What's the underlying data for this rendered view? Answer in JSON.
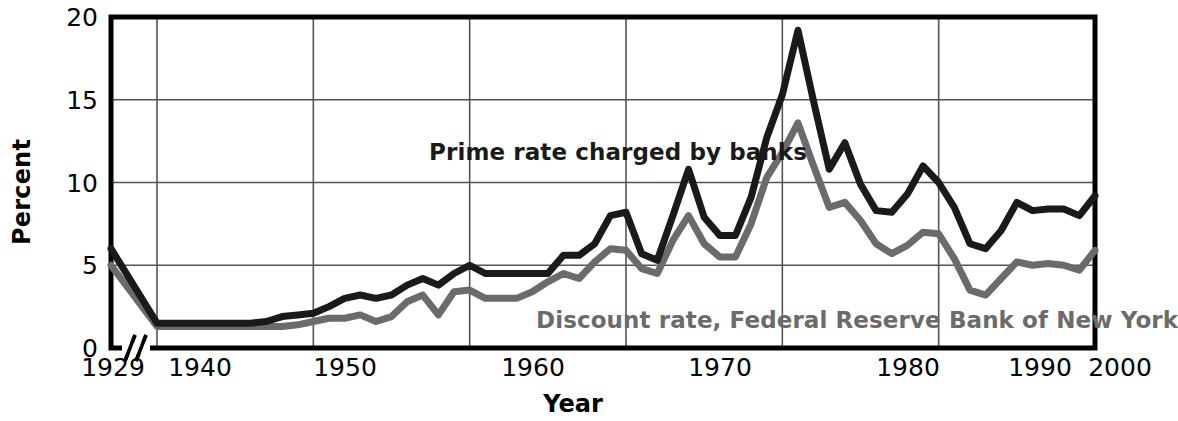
{
  "chart_data": {
    "type": "line",
    "title": "",
    "xlabel": "Year",
    "ylabel": "Percent",
    "ylim": [
      0,
      20
    ],
    "yticks": [
      0,
      5,
      10,
      15,
      20
    ],
    "ytick_labels": [
      "0",
      "5",
      "10",
      "15",
      "20"
    ],
    "xticks": [
      1929,
      1940,
      1950,
      1960,
      1970,
      1980,
      1990,
      2000
    ],
    "xtick_labels": [
      "1929",
      "1940",
      "1950",
      "1960",
      "1970",
      "1980",
      "1990",
      "2000"
    ],
    "axis_break": true,
    "axis_break_note": "break in x-axis between 1929 and 1940",
    "grid": true,
    "legend_position": "inline-annotations",
    "colors": {
      "prime_rate": "#1a1a1a",
      "discount_rate": "#6b6b6b",
      "axis": "#000000",
      "grid": "#555555",
      "background": "#ffffff"
    },
    "annotations": [
      {
        "text": "Prime rate charged by banks",
        "color": "#1a1a1a"
      },
      {
        "text": "Discount rate, Federal Reserve Bank of New York",
        "color": "#6b6b6b"
      }
    ],
    "x": [
      1929,
      1940,
      1941,
      1942,
      1943,
      1944,
      1945,
      1946,
      1947,
      1948,
      1949,
      1950,
      1951,
      1952,
      1953,
      1954,
      1955,
      1956,
      1957,
      1958,
      1959,
      1960,
      1961,
      1962,
      1963,
      1964,
      1965,
      1966,
      1967,
      1968,
      1969,
      1970,
      1971,
      1972,
      1973,
      1974,
      1975,
      1976,
      1977,
      1978,
      1979,
      1980,
      1981,
      1982,
      1983,
      1984,
      1985,
      1986,
      1987,
      1988,
      1989,
      1990,
      1991,
      1992,
      1993,
      1994,
      1995,
      1996,
      1997,
      1998,
      1999,
      2000
    ],
    "series": [
      {
        "name": "Prime rate charged by banks",
        "color": "#1a1a1a",
        "values": [
          6.0,
          1.5,
          1.5,
          1.5,
          1.5,
          1.5,
          1.5,
          1.5,
          1.6,
          1.9,
          2.0,
          2.1,
          2.5,
          3.0,
          3.2,
          3.0,
          3.2,
          3.8,
          4.2,
          3.8,
          4.5,
          5.0,
          4.5,
          4.5,
          4.5,
          4.5,
          4.5,
          5.6,
          5.6,
          6.3,
          8.0,
          8.2,
          5.7,
          5.3,
          8.0,
          10.8,
          7.9,
          6.8,
          6.8,
          9.1,
          12.7,
          15.3,
          19.2,
          14.9,
          10.8,
          12.4,
          9.9,
          8.3,
          8.2,
          9.3,
          11.0,
          10.0,
          8.5,
          6.3,
          6.0,
          7.1,
          8.8,
          8.3,
          8.4,
          8.4,
          8.0,
          9.2
        ]
      },
      {
        "name": "Discount rate, Federal Reserve Bank of New York",
        "color": "#6b6b6b",
        "values": [
          5.0,
          1.3,
          1.3,
          1.3,
          1.3,
          1.3,
          1.3,
          1.3,
          1.3,
          1.3,
          1.4,
          1.6,
          1.8,
          1.8,
          2.0,
          1.6,
          1.9,
          2.8,
          3.2,
          2.0,
          3.4,
          3.5,
          3.0,
          3.0,
          3.0,
          3.4,
          4.0,
          4.5,
          4.2,
          5.2,
          6.0,
          5.9,
          4.8,
          4.5,
          6.5,
          8.0,
          6.3,
          5.5,
          5.5,
          7.5,
          10.3,
          11.8,
          13.6,
          11.0,
          8.5,
          8.8,
          7.7,
          6.3,
          5.7,
          6.2,
          7.0,
          6.9,
          5.4,
          3.5,
          3.2,
          4.2,
          5.2,
          5.0,
          5.1,
          5.0,
          4.7,
          5.9
        ]
      }
    ]
  },
  "axes": {
    "y_title": "Percent",
    "x_title": "Year"
  }
}
